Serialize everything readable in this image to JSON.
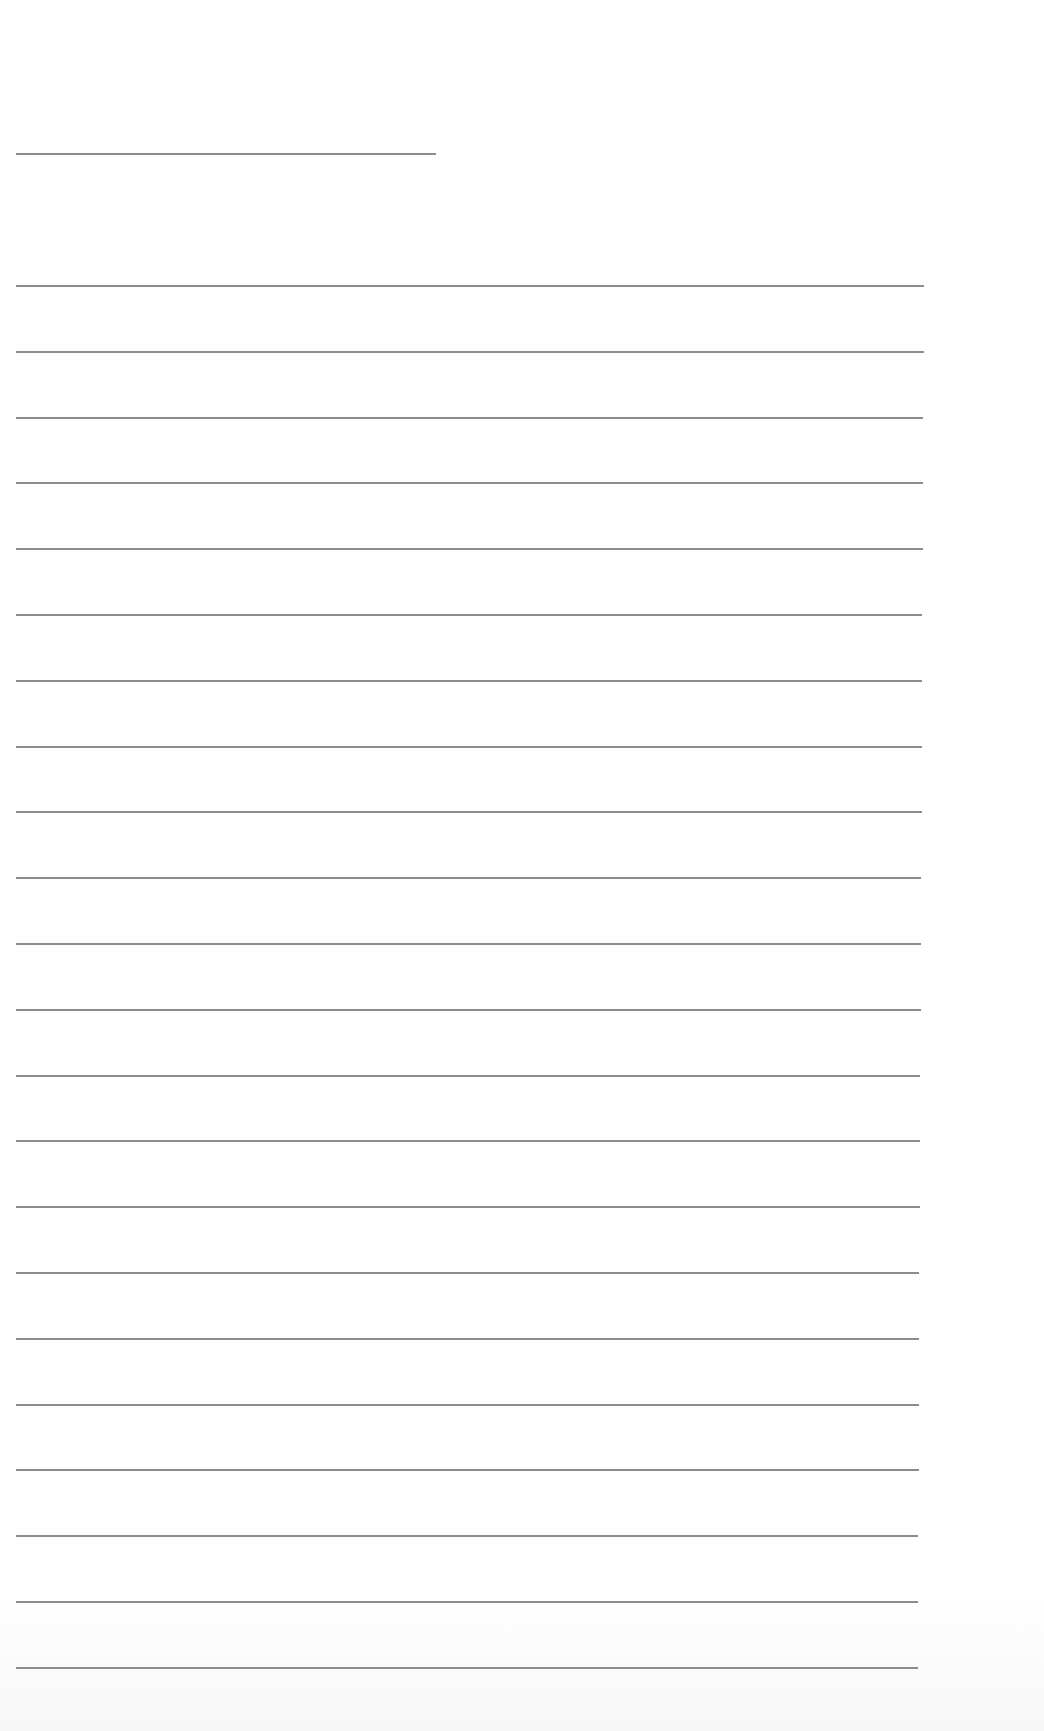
{
  "document": {
    "type": "ruled-sheet",
    "title_line": {
      "text": "",
      "left": 16,
      "top": 153,
      "width": 420
    },
    "ruled_lines": {
      "count": 22,
      "first_top": 285,
      "spacing": 65.8,
      "left": 16,
      "width": 908,
      "values": [
        "",
        "",
        "",
        "",
        "",
        "",
        "",
        "",
        "",
        "",
        "",
        "",
        "",
        "",
        "",
        "",
        "",
        "",
        "",
        "",
        "",
        ""
      ]
    },
    "line_color": "#8c8c8c",
    "background_color": "#ffffff"
  }
}
